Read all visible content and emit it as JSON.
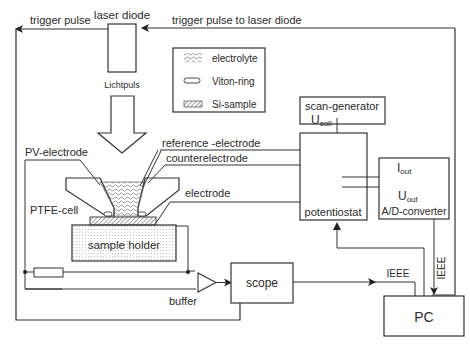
{
  "labels": {
    "trigger_pulse": "trigger pulse",
    "laser_diode": "laser diode",
    "trigger_to_laser": "trigger pulse to laser diode",
    "lichtpuls": "Lichtpuls",
    "pv_electrode": "PV-electrode",
    "reference_electrode": "reference -electrode",
    "counterelectrode": "counterelectrode",
    "electrode": "electrode",
    "ptfe_cell": "PTFE-cell",
    "sample_holder": "sample holder",
    "buffer": "buffer",
    "scope": "scope",
    "scan_generator": "scan-generator",
    "u_soll_main": "U",
    "u_soll_sub": "soll",
    "potentiostat": "potentiostat",
    "i_out_main": "I",
    "i_out_sub": "out",
    "u_out_main": "U",
    "u_out_sub": "out",
    "ad_converter": "A/D-converter",
    "ieee_horizontal": "IEEE",
    "ieee_vertical": "IEEE",
    "pc": "PC"
  },
  "legend": {
    "items": [
      {
        "icon": "electrolyte-wave-icon",
        "label": "electrolyte"
      },
      {
        "icon": "viton-ring-icon",
        "label": "Viton-ring"
      },
      {
        "icon": "si-sample-hatch-icon",
        "label": "Si-sample"
      }
    ]
  }
}
